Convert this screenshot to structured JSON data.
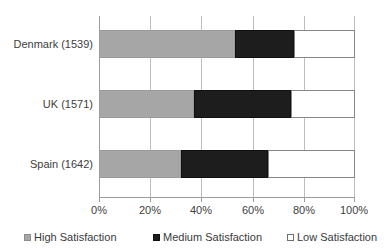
{
  "chart_data": {
    "type": "bar",
    "orientation": "horizontal",
    "stacked": true,
    "stack_mode": "percent",
    "title": "",
    "xlabel": "",
    "ylabel": "",
    "xlim": [
      0,
      100
    ],
    "grid": true,
    "legend_position": "bottom",
    "categories": [
      "Denmark (1539)",
      "UK (1571)",
      "Spain (1642)"
    ],
    "xtick_labels": [
      "0%",
      "20%",
      "40%",
      "60%",
      "80%",
      "100%"
    ],
    "xtick_values": [
      0,
      20,
      40,
      60,
      80,
      100
    ],
    "series": [
      {
        "name": "High Satisfaction",
        "color": "#a6a6a6",
        "values": [
          53,
          37,
          32
        ]
      },
      {
        "name": "Medium Satisfaction",
        "color": "#1d1d1d",
        "values": [
          23,
          38,
          34
        ]
      },
      {
        "name": "Low Satisfaction",
        "color": "#ffffff",
        "values": [
          24,
          25,
          34
        ]
      }
    ],
    "cumulative_edges": [
      [
        53,
        76,
        100
      ],
      [
        37,
        75,
        100
      ],
      [
        32,
        66,
        100
      ]
    ]
  },
  "axis": {
    "category_labels": [
      {
        "label": "Denmark (1539)"
      },
      {
        "label": "UK (1571)"
      },
      {
        "label": "Spain (1642)"
      }
    ],
    "ticks": [
      {
        "label": "0%",
        "value": 0
      },
      {
        "label": "20%",
        "value": 20
      },
      {
        "label": "40%",
        "value": 40
      },
      {
        "label": "60%",
        "value": 60
      },
      {
        "label": "80%",
        "value": 80
      },
      {
        "label": "100%",
        "value": 100
      }
    ]
  },
  "legend": {
    "items": [
      {
        "label": "High Satisfaction",
        "swatch": "high-satisfaction-swatch"
      },
      {
        "label": "Medium Satisfaction",
        "swatch": "medium-satisfaction-swatch"
      },
      {
        "label": "Low Satisfaction",
        "swatch": "low-satisfaction-swatch"
      }
    ]
  },
  "colors": {
    "high": "#a6a6a6",
    "medium": "#1d1d1d",
    "low": "#ffffff",
    "gridline": "#bfbfbf",
    "axis": "#9c9c9c",
    "text": "#3a3a3a"
  }
}
